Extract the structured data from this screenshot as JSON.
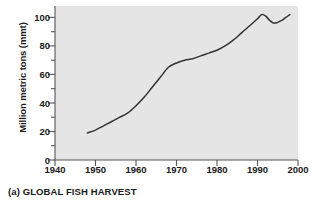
{
  "caption": "(a) GLOBAL FISH HARVEST",
  "colors": {
    "plot_background": "#e5e5e5",
    "page_background": "#ffffff",
    "line": "#333333",
    "axis": "#555555",
    "text": "#1a1a1a"
  },
  "chart_data": {
    "type": "line",
    "title": "(a) GLOBAL FISH HARVEST",
    "xlabel": "",
    "ylabel": "Million metric tons (mmt)",
    "xlim": [
      1940,
      2000
    ],
    "ylim": [
      0,
      108
    ],
    "grid": false,
    "legend": null,
    "xticks": [
      1940,
      1950,
      1960,
      1970,
      1980,
      1990,
      2000
    ],
    "xtick_labels": [
      "1940",
      "1950",
      "1960",
      "1970",
      "1980",
      "1990",
      "2000"
    ],
    "yticks": [
      0,
      20,
      40,
      60,
      80,
      100
    ],
    "ytick_labels": [
      "0",
      "20",
      "40",
      "60",
      "80",
      "100"
    ],
    "y_minor_ticks": [
      10,
      30,
      50,
      70,
      90
    ],
    "series": [
      {
        "name": "Global fish harvest",
        "units": "mmt",
        "x": [
          1948,
          1950,
          1952,
          1954,
          1956,
          1958,
          1960,
          1962,
          1964,
          1966,
          1968,
          1970,
          1972,
          1974,
          1976,
          1978,
          1980,
          1982,
          1984,
          1986,
          1988,
          1990,
          1991,
          1992,
          1993,
          1994,
          1995,
          1996,
          1997,
          1998
        ],
        "values": [
          19,
          21,
          24,
          27,
          30,
          33,
          38,
          44,
          51,
          58,
          65,
          68,
          70,
          71,
          73,
          75,
          77,
          80,
          84,
          89,
          94,
          99,
          102,
          101,
          98,
          96,
          96.5,
          98,
          100,
          102
        ]
      }
    ]
  }
}
